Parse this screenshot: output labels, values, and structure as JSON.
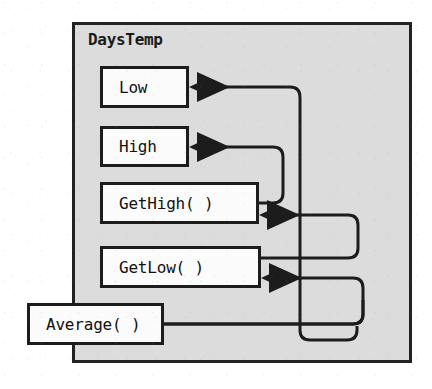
{
  "diagram": {
    "type": "uml-class-diagram",
    "title": "DaysTemp",
    "container": {
      "label": "DaysTemp",
      "fill_color": "#dcdcdc",
      "border_color": "#222222"
    },
    "members": [
      {
        "id": "low",
        "label": "Low",
        "kind": "attribute"
      },
      {
        "id": "high",
        "label": "High",
        "kind": "attribute"
      },
      {
        "id": "gethigh",
        "label": "GetHigh( )",
        "kind": "method"
      },
      {
        "id": "getlow",
        "label": "GetLow( )",
        "kind": "method"
      },
      {
        "id": "average",
        "label": "Average( )",
        "kind": "method"
      }
    ],
    "connectors": [
      {
        "id": "average-to-low",
        "from": "average",
        "to": "low",
        "style": "orthogonal-rounded",
        "arrowhead": "solid-triangle-left"
      },
      {
        "id": "gethigh-to-high",
        "from": "gethigh",
        "to": "high",
        "style": "orthogonal-rounded",
        "arrowhead": "solid-triangle-left"
      },
      {
        "id": "getlow-to-gethigh",
        "from": "getlow",
        "to": "gethigh",
        "style": "orthogonal-rounded",
        "arrowhead": "solid-triangle-left"
      },
      {
        "id": "average-to-getlow",
        "from": "average",
        "to": "getlow",
        "style": "orthogonal-rounded",
        "arrowhead": "solid-triangle-left"
      }
    ],
    "line_color": "#1c1c1c",
    "box_fill_color": "#fbfbfb",
    "ghost_marks": [
      {
        "text": "",
        "x": 18,
        "y": 44
      },
      {
        "text": "",
        "x": 196,
        "y": 44
      },
      {
        "text": "",
        "x": 14,
        "y": 196
      }
    ]
  }
}
